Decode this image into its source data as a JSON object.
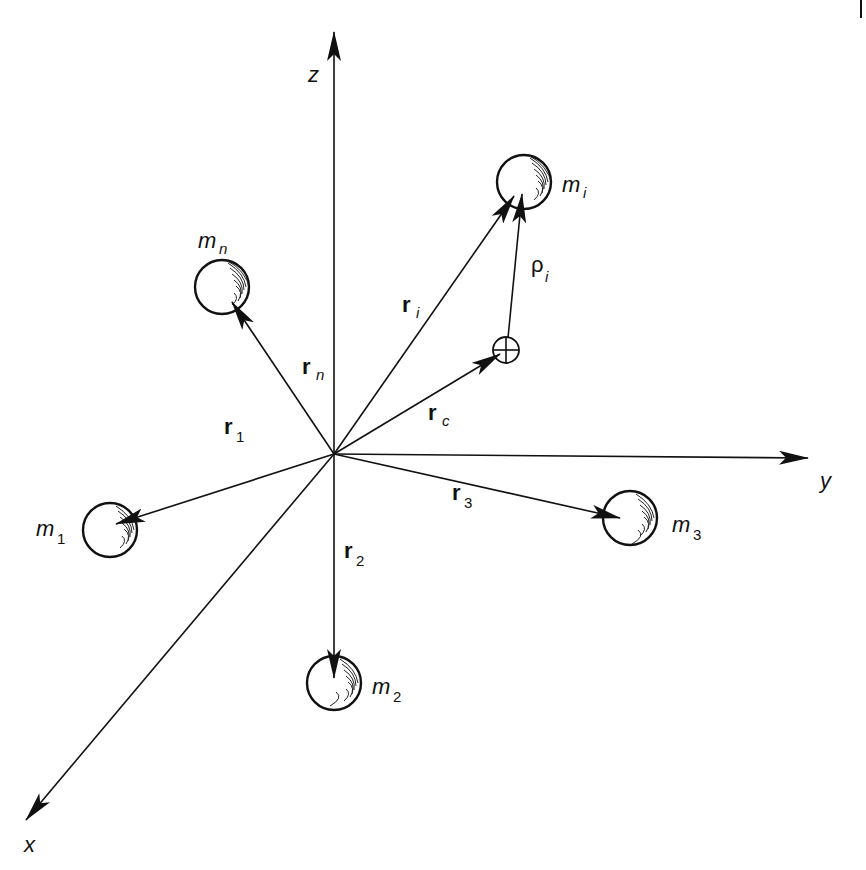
{
  "figure": {
    "axes": {
      "x": {
        "label": "x"
      },
      "y": {
        "label": "y"
      },
      "z": {
        "label": "z"
      }
    },
    "origin": {
      "x": 334,
      "y": 454
    },
    "center_of_mass": {
      "marker": "⊕",
      "vector_label": "r",
      "vector_sub": "c",
      "x": 506,
      "y": 350
    },
    "masses": [
      {
        "id": "m1",
        "label": "m",
        "sub": "1",
        "x": 110,
        "y": 530,
        "vector_label": "r",
        "vector_sub": "1"
      },
      {
        "id": "m2",
        "label": "m",
        "sub": "2",
        "x": 334,
        "y": 683,
        "vector_label": "r",
        "vector_sub": "2"
      },
      {
        "id": "m3",
        "label": "m",
        "sub": "3",
        "x": 630,
        "y": 518,
        "vector_label": "r",
        "vector_sub": "3"
      },
      {
        "id": "mn",
        "label": "m",
        "sub": "n",
        "x": 222,
        "y": 287,
        "vector_label": "r",
        "vector_sub": "n"
      },
      {
        "id": "mi",
        "label": "m",
        "sub": "i",
        "x": 524,
        "y": 182,
        "vector_label": "r",
        "vector_sub": "i"
      }
    ],
    "relative_vector": {
      "label": "ρ",
      "sub": "i"
    }
  }
}
